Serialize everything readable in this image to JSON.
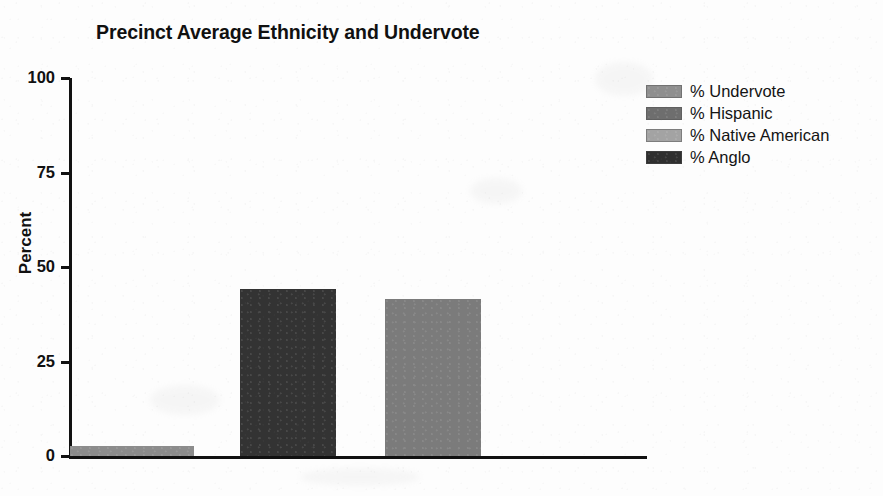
{
  "chart_data": {
    "type": "bar",
    "title": "Precinct Average Ethnicity and Undervote",
    "xlabel": "",
    "ylabel": "Percent",
    "ylim": [
      0,
      100
    ],
    "yticks": [
      0,
      25,
      50,
      75,
      100
    ],
    "ytick_labels": [
      "0",
      "25",
      "50",
      "75",
      "100"
    ],
    "grid": false,
    "legend_position": "top-right",
    "categories": [
      "% Undervote",
      "% Anglo",
      "% Hispanic"
    ],
    "values": [
      2.6,
      44.2,
      41.5
    ],
    "series": [
      {
        "name": "Precinct Average",
        "values": [
          2.6,
          44.2,
          41.5
        ]
      }
    ],
    "bars": [
      {
        "label": "% Undervote",
        "value": 2.6,
        "color": "#8c8c8c"
      },
      {
        "label": "% Anglo",
        "value": 44.2,
        "color": "#333333"
      },
      {
        "label": "% Hispanic",
        "value": 41.5,
        "color": "#7b7b7b"
      }
    ],
    "legend": [
      {
        "label": "% Undervote",
        "color": "#8f8f8f"
      },
      {
        "label": "% Hispanic",
        "color": "#6e6e6e"
      },
      {
        "label": "% Native American",
        "color": "#a3a3a3"
      },
      {
        "label": "% Anglo",
        "color": "#2f2f2f"
      }
    ]
  },
  "colors": {
    "axis": "#111111",
    "text": "#101010",
    "background": "#fdfdfd"
  }
}
